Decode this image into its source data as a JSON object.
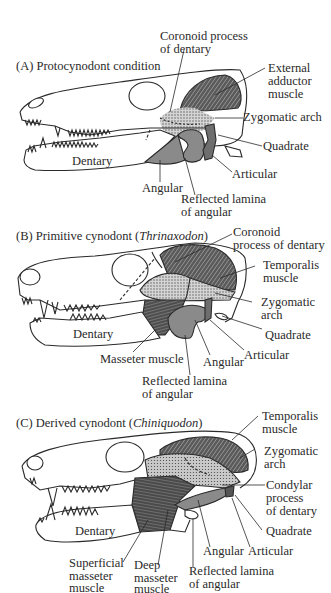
{
  "figure": {
    "colors": {
      "outline": "#2a2a2a",
      "muscle_dark": "#555555",
      "muscle_stipple": "#b5b5b5",
      "bone_gray": "#8a8a8a",
      "background": "#ffffff"
    },
    "panels": [
      {
        "id": "A",
        "title": "(A)  Protocynodont condition",
        "title_genus": "",
        "title_suffix": "",
        "labels": {
          "coronoid": [
            "Coronoid process",
            "of dentary"
          ],
          "external_adductor": [
            "External",
            "adductor",
            "muscle"
          ],
          "zygomatic": "Zygomatic arch",
          "quadrate": "Quadrate",
          "articular": "Articular",
          "angular": "Angular",
          "reflected_lamina": [
            "Reflected lamina",
            "of angular"
          ],
          "dentary": "Dentary"
        }
      },
      {
        "id": "B",
        "title": "(B)  Primitive cynodont (",
        "title_genus": "Thrinaxodon",
        "title_suffix": ")",
        "labels": {
          "coronoid": [
            "Coronoid",
            "process of dentary"
          ],
          "temporalis": [
            "Temporalis",
            "muscle"
          ],
          "zygomatic": [
            "Zygomatic",
            "arch"
          ],
          "quadrate": "Quadrate",
          "articular": "Articular",
          "angular": "Angular",
          "masseter": "Masseter muscle",
          "reflected_lamina": [
            "Reflected lamina",
            "of angular"
          ],
          "dentary": "Dentary"
        }
      },
      {
        "id": "C",
        "title": "(C)  Derived cynodont (",
        "title_genus": "Chiniquodon",
        "title_suffix": ")",
        "labels": {
          "temporalis": [
            "Temporalis",
            "muscle"
          ],
          "zygomatic": [
            "Zygomatic",
            "arch"
          ],
          "condylar": [
            "Condylar",
            "process",
            "of dentary"
          ],
          "quadrate": "Quadrate",
          "articular": "Articular",
          "angular": "Angular",
          "superficial_masseter": [
            "Superficial",
            "masseter",
            "muscle"
          ],
          "deep_masseter": [
            "Deep",
            "masseter",
            "muscle"
          ],
          "reflected_lamina": [
            "Reflected lamina",
            "of angular"
          ],
          "dentary": "Dentary"
        }
      }
    ]
  }
}
